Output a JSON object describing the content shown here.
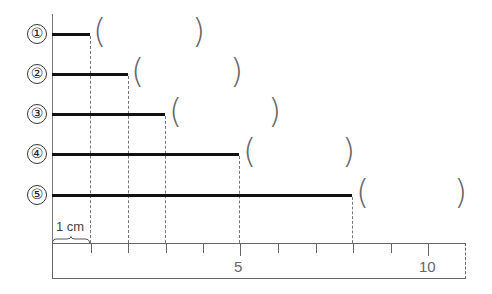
{
  "diagram": {
    "title": "",
    "unit_px_per_cm": 37.5,
    "origin_x": 52,
    "items": [
      {
        "label": "①",
        "length_cm": 1,
        "y": 34,
        "answer": ""
      },
      {
        "label": "②",
        "length_cm": 2,
        "y": 74,
        "answer": ""
      },
      {
        "label": "③",
        "length_cm": 3,
        "y": 114,
        "answer": ""
      },
      {
        "label": "④",
        "length_cm": 5,
        "y": 154,
        "answer": ""
      },
      {
        "label": "⑤",
        "length_cm": 8,
        "y": 195,
        "answer": ""
      }
    ],
    "unit_label": "1 cm",
    "ruler": {
      "range_cm": [
        0,
        11
      ],
      "tick_labels": [
        {
          "value": 5,
          "text": "5"
        },
        {
          "value": 10,
          "text": "10"
        }
      ]
    },
    "paren_open": "(",
    "paren_close": ")"
  }
}
